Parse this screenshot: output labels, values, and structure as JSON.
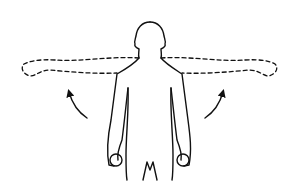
{
  "figure": {
    "elements": [
      "figure-body",
      "dashed-raised-arms",
      "left-arrow",
      "right-arrow"
    ],
    "colors": {
      "stroke": "#111111",
      "background": "#ffffff"
    }
  }
}
